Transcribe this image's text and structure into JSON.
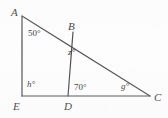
{
  "figure": {
    "kind": "geometry-diagram",
    "background_color": "#fdfdfd",
    "stroke_color": "#3a3a3a",
    "text_color": "#1c1c1c",
    "canvas": {
      "width": 168,
      "height": 118
    },
    "points": [
      {
        "id": "A",
        "label": "A",
        "x": 22,
        "y": 16,
        "label_x": 11,
        "label_y": 7
      },
      {
        "id": "B",
        "label": "B",
        "x": 73,
        "y": 32,
        "label_x": 68,
        "label_y": 21
      },
      {
        "id": "C",
        "label": "C",
        "x": 150,
        "y": 96,
        "label_x": 154,
        "label_y": 92
      },
      {
        "id": "D",
        "label": "D",
        "x": 68,
        "y": 96,
        "label_x": 64,
        "label_y": 101
      },
      {
        "id": "E",
        "label": "E",
        "x": 22,
        "y": 96,
        "label_x": 13,
        "label_y": 101
      }
    ],
    "segments": [
      {
        "id": "AE",
        "from": "A",
        "to": "E"
      },
      {
        "id": "AC",
        "from": "A",
        "to": "C"
      },
      {
        "id": "EC",
        "from": "E",
        "to": "C"
      },
      {
        "id": "BD",
        "from": "B",
        "to": "D"
      }
    ],
    "angles": [
      {
        "id": "angle-A",
        "at": "A",
        "value": "50",
        "unit": "°",
        "text": "50°",
        "is_variable": false,
        "x": 28,
        "y": 29
      },
      {
        "id": "angle-B",
        "at": "B",
        "value": "z",
        "unit": "°",
        "text": "z°",
        "is_variable": true,
        "x": 68,
        "y": 48
      },
      {
        "id": "angle-D",
        "at": "D",
        "value": "70",
        "unit": "°",
        "text": "70°",
        "is_variable": false,
        "x": 74,
        "y": 83
      },
      {
        "id": "angle-C",
        "at": "C",
        "value": "g",
        "unit": "°",
        "text": "g°",
        "is_variable": true,
        "x": 121,
        "y": 82
      },
      {
        "id": "angle-E",
        "at": "E",
        "value": "h",
        "unit": "°",
        "text": "h°",
        "is_variable": true,
        "x": 27,
        "y": 80
      }
    ]
  }
}
